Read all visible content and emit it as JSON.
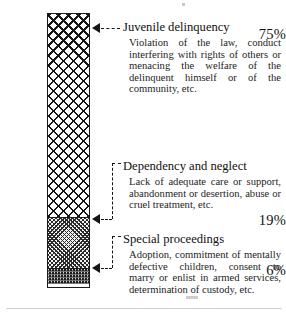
{
  "chart_data": {
    "type": "bar",
    "orientation": "vertical-stacked",
    "title": "",
    "xlabel": "",
    "ylabel": "",
    "categories": [
      "Juvenile delinquency",
      "Dependency and neglect",
      "Special proceedings"
    ],
    "values": [
      75,
      19,
      6
    ],
    "value_labels": [
      "75%",
      "19%",
      "6%"
    ],
    "units": "percent",
    "ylim": [
      0,
      100
    ],
    "grid": false,
    "legend": "none",
    "segments": [
      {
        "label": "Juvenile delinquency",
        "value": 75,
        "value_label": "75%",
        "pattern": "open-crosshatch",
        "description": "Violation of the law, conduct interfering with rights of others or menacing the welfare of the delinquent himself or of the community, etc."
      },
      {
        "label": "Dependency and neglect",
        "value": 19,
        "value_label": "19%",
        "pattern": "fine-crosshatch",
        "description": "Lack of adequate care or support, abandonment or desertion, abuse or cruel treatment, etc."
      },
      {
        "label": "Special proceedings",
        "value": 6,
        "value_label": "6%",
        "pattern": "dark-speckle",
        "description": "Adoption, commitment of mentally defective children, consent to marry or enlist in armed services, determination of custody, etc."
      }
    ]
  },
  "colors": {
    "ink": "#141414",
    "paper": "#ffffff",
    "segment_dark": "#1b1b1b",
    "segment_mid": "#f2f2f2",
    "hairline": "#cfcfcf"
  },
  "axis_labels": {
    "top": "75%",
    "middle": "19%",
    "bottom": "6%"
  },
  "callouts": {
    "juvenile": {
      "title": "Juvenile delinquency",
      "body": "Violation of the law, conduct interfering with rights of others or menacing the welfare of the delinquent himself or of the community, etc."
    },
    "dependency": {
      "title": "Dependency and neglect",
      "body": "Lack of adequate care or support, abandonment or desertion, abuse or cruel treatment, etc."
    },
    "special": {
      "title": "Special proceedings",
      "body": "Adoption, commitment of mentally defective children, consent to marry or enlist in armed services, determination of custody, etc."
    }
  }
}
